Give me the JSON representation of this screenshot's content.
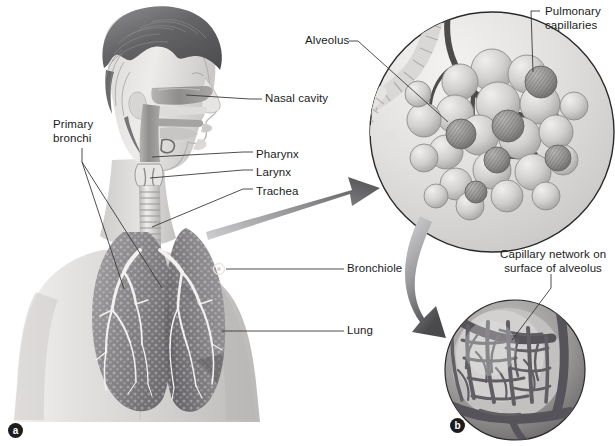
{
  "figure": {
    "background_color": "#ffffff",
    "width": 615,
    "height": 446,
    "style": "grayscale medical illustration"
  },
  "panels": [
    {
      "tag": "a",
      "name": "torso-overview",
      "description": "Head, neck and thorax of a male figure showing the respiratory tract with both lungs"
    },
    {
      "tag": "b",
      "name": "alveolus-surface-detail",
      "description": "Magnified single alveolus showing capillary network on its surface"
    }
  ],
  "labels": {
    "nasal_cavity": "Nasal cavity",
    "pharynx": "Pharynx",
    "larynx": "Larynx",
    "trachea": "Trachea",
    "primary_bronchi": "Primary\nbronchi",
    "bronchiole": "Bronchiole",
    "lung": "Lung",
    "alveolus": "Alveolus",
    "pulmonary_capillaries": "Pulmonary\ncapillaries",
    "capillary_network": "Capillary network on\nsurface of alveolus"
  },
  "panel_tags": {
    "a": "a",
    "b": "b"
  },
  "colors": {
    "text": "#1b1b1b",
    "leader_line": "#3a3a3a",
    "arrow_dark": "#58585a",
    "arrow_light": "#c9c9cb",
    "circle_outline": "#2a2a2a",
    "lung_tissue": "#8e8e90",
    "skin_light": "#e4e2e0",
    "hair_dark": "#6b6b6d",
    "airway_mid": "#9a9a9c",
    "alveoli_light": "#d6d6d8",
    "capillary_dark": "#4a4a4c"
  }
}
